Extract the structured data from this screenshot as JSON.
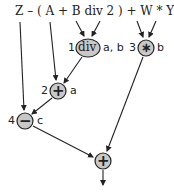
{
  "expression": "Z – ( A + B div 2 ) + W * Y",
  "nodes": [
    {
      "id": "div",
      "order": "1",
      "operator": "div",
      "result": "a, b"
    },
    {
      "id": "mul",
      "order": "3",
      "operator": "∗",
      "result": "b"
    },
    {
      "id": "add1",
      "order": "2",
      "operator": "+",
      "result": "a"
    },
    {
      "id": "sub",
      "order": "4",
      "operator": "−",
      "result": "c"
    },
    {
      "id": "add2",
      "order": "",
      "operator": "+",
      "result": ""
    }
  ],
  "colors": {
    "node_fill": "#c8c8c8",
    "stroke": "#222222"
  }
}
